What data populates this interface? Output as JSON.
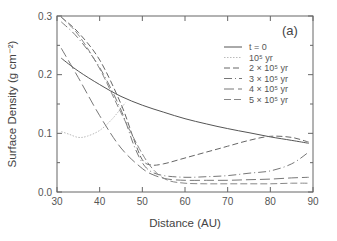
{
  "chart_data": {
    "type": "line",
    "title": "",
    "panel_label": "(a)",
    "xlabel": "Distance (AU)",
    "ylabel": "Surface Density (g cm⁻²)",
    "xlim": [
      30,
      90
    ],
    "ylim": [
      0.0,
      0.3
    ],
    "xticks": [
      30,
      40,
      50,
      60,
      70,
      80,
      90
    ],
    "xtick_labels": [
      "30",
      "40",
      "50",
      "60",
      "70",
      "80",
      "90"
    ],
    "yticks": [
      0.0,
      0.1,
      0.2,
      0.3
    ],
    "ytick_labels": [
      "0.0",
      "0.1",
      "0.2",
      "0.3"
    ],
    "grid": false,
    "legend_position": "upper right",
    "series": [
      {
        "name": "t = 0",
        "dash": "",
        "color": "#555555",
        "x": [
          31,
          35,
          40,
          45,
          50,
          55,
          60,
          65,
          70,
          75,
          80,
          85,
          89
        ],
        "y": [
          0.228,
          0.206,
          0.183,
          0.163,
          0.148,
          0.136,
          0.125,
          0.116,
          0.108,
          0.101,
          0.094,
          0.088,
          0.083
        ]
      },
      {
        "name": "10⁵ yr",
        "dash": "1.5,1.5",
        "color": "#bbbbbb",
        "x": [
          31,
          33,
          35,
          37,
          40,
          43,
          46
        ],
        "y": [
          0.103,
          0.098,
          0.093,
          0.095,
          0.105,
          0.125,
          0.152
        ]
      },
      {
        "name": "2 × 10⁵ yr",
        "dash": "6,3",
        "color": "#666666",
        "x": [
          31,
          35,
          40,
          45,
          48,
          50,
          52,
          55,
          60,
          65,
          70,
          75,
          80,
          85,
          89
        ],
        "y": [
          0.298,
          0.272,
          0.225,
          0.15,
          0.09,
          0.055,
          0.046,
          0.048,
          0.058,
          0.068,
          0.078,
          0.088,
          0.095,
          0.093,
          0.085
        ]
      },
      {
        "name": "3 × 10⁵ yr",
        "dash": "8,3,1,3",
        "color": "#777777",
        "x": [
          31,
          35,
          40,
          45,
          48,
          50,
          52,
          55,
          60,
          65,
          70,
          75,
          80,
          85,
          89
        ],
        "y": [
          0.29,
          0.262,
          0.212,
          0.14,
          0.08,
          0.05,
          0.035,
          0.028,
          0.025,
          0.026,
          0.028,
          0.032,
          0.036,
          0.048,
          0.068
        ]
      },
      {
        "name": "4 × 10⁵ yr",
        "dash": "10,4",
        "color": "#777777",
        "x": [
          31,
          35,
          40,
          45,
          50,
          53,
          56,
          60,
          65,
          70,
          75,
          80,
          85,
          89
        ],
        "y": [
          0.245,
          0.195,
          0.13,
          0.075,
          0.04,
          0.028,
          0.022,
          0.02,
          0.02,
          0.02,
          0.021,
          0.022,
          0.024,
          0.025
        ]
      },
      {
        "name": "5 × 10⁵ yr",
        "dash": "7,3",
        "color": "#888888",
        "x": [
          31,
          35,
          40,
          45,
          50,
          53,
          56,
          60,
          65,
          70,
          75,
          80,
          85,
          89
        ],
        "y": [
          0.298,
          0.268,
          0.21,
          0.135,
          0.065,
          0.035,
          0.02,
          0.015,
          0.014,
          0.014,
          0.014,
          0.014,
          0.015,
          0.015
        ]
      }
    ]
  }
}
